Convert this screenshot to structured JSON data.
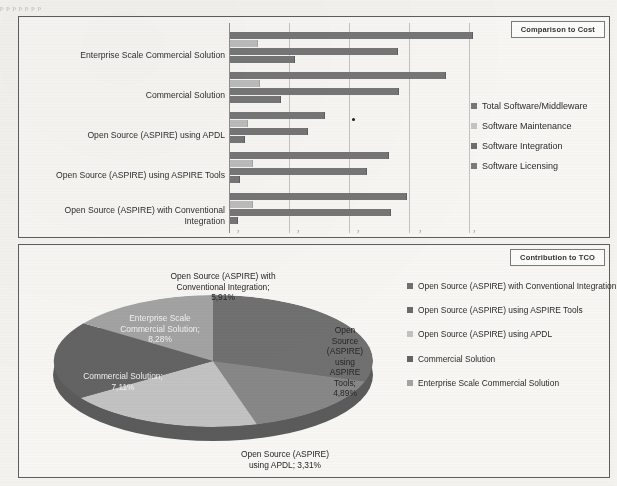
{
  "page": {
    "faint_header": "p p p p p p p"
  },
  "bar_chart": {
    "title": "Comparison to Cost",
    "categories": [
      "Enterprise Scale Commercial Solution",
      "Commercial Solution",
      "Open Source (ASPIRE) using APDL",
      "Open Source (ASPIRE) using ASPIRE Tools",
      "Open Source (ASPIRE) with Conventional Integration"
    ],
    "legend": [
      {
        "label": "Total Software/Middleware",
        "color": "#767676"
      },
      {
        "label": "Software Maintenance",
        "color": "#bcbcbc"
      },
      {
        "label": "Software Integration",
        "color": "#767676"
      },
      {
        "label": "Software Licensing",
        "color": "#767676"
      }
    ]
  },
  "pie_chart": {
    "title": "Contribution to TCO",
    "labels": [
      {
        "text": "Open Source (ASPIRE) with Conventional Integration;",
        "value": "5,91%"
      },
      {
        "text": "Open Source (ASPIRE) using ASPIRE Tools;",
        "value": "4,89%"
      },
      {
        "text": "Open Source (ASPIRE) using APDL;",
        "value": "3,31%"
      },
      {
        "text": "Commercial Solution;",
        "value": "7,11%"
      },
      {
        "text": "Enterprise Scale Commercial Solution;",
        "value": "8,28%"
      }
    ],
    "label_lines": {
      "conventional": "Open Source (ASPIRE) with\nConventional Integration;\n5,91%",
      "aspire_tools": "Open\nSource\n(ASPIRE)\nusing\nASPIRE\nTools;\n4,89%",
      "apdl": "Open Source (ASPIRE)\nusing APDL; 3,31%",
      "commercial": "Commercial Solution;\n7,11%",
      "enterprise": "Enterprise Scale\nCommercial Solution;\n8,28%"
    },
    "legend": [
      {
        "label": "Open Source (ASPIRE) with Conventional Integration",
        "color": "#707070"
      },
      {
        "label": "Open Source (ASPIRE) using ASPIRE Tools",
        "color": "#6a6a6a"
      },
      {
        "label": "Open Source (ASPIRE) using APDL",
        "color": "#c2c2c2"
      },
      {
        "label": "Commercial Solution",
        "color": "#636363"
      },
      {
        "label": "Enterprise Scale Commercial Solution",
        "color": "#a3a3a3"
      }
    ]
  },
  "chart_data": [
    {
      "type": "bar",
      "orientation": "horizontal",
      "title": "Comparison to Cost",
      "xlabel": "",
      "ylabel": "",
      "grid": true,
      "legend_position": "right",
      "axis_tick_labels": [],
      "categories": [
        "Enterprise Scale Commercial Solution",
        "Commercial Solution",
        "Open Source (ASPIRE) using APDL",
        "Open Source (ASPIRE) using ASPIRE Tools",
        "Open Source (ASPIRE) with Conventional Integration"
      ],
      "series": [
        {
          "name": "Total Software/Middleware",
          "color": "#767676",
          "values": [
            98,
            87,
            38,
            64,
            71
          ]
        },
        {
          "name": "Software Maintenance",
          "color": "#bcbcbc",
          "values": [
            11,
            12,
            7,
            9,
            9
          ]
        },
        {
          "name": "Software Integration",
          "color": "#767676",
          "values": [
            68,
            68,
            31,
            55,
            65
          ]
        },
        {
          "name": "Software Licensing",
          "color": "#767676",
          "values": [
            26,
            20,
            6,
            4,
            3
          ]
        }
      ],
      "xlim": [
        0,
        110
      ]
    },
    {
      "type": "pie",
      "title": "Contribution to TCO",
      "three_d": true,
      "legend_position": "right",
      "labels": [
        "Open Source (ASPIRE) with Conventional Integration",
        "Open Source (ASPIRE) using ASPIRE Tools",
        "Open Source (ASPIRE) using APDL",
        "Commercial Solution",
        "Enterprise Scale Commercial Solution"
      ],
      "displayed_percentages": [
        "5,91%",
        "4,89%",
        "3,31%",
        "7,11%",
        "8,28%"
      ],
      "values": [
        5.91,
        4.89,
        3.31,
        7.11,
        8.28
      ],
      "slice_sweep_degrees": [
        108,
        56,
        72,
        70,
        54
      ],
      "colors": [
        "#707070",
        "#6a6a6a",
        "#c2c2c2",
        "#636363",
        "#a3a3a3"
      ]
    }
  ]
}
